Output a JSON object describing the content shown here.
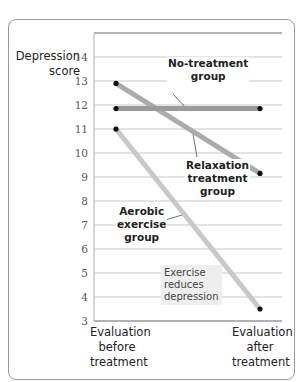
{
  "chart_data": {
    "type": "line",
    "title": "",
    "xlabel": "",
    "ylabel": "Depression score",
    "ylim": [
      3,
      14
    ],
    "yticks": [
      3,
      4,
      5,
      6,
      7,
      8,
      9,
      10,
      11,
      12,
      13,
      14
    ],
    "categories": [
      "Evaluation before treatment",
      "Evaluation after treatment"
    ],
    "grid": true,
    "series": [
      {
        "name": "No-treatment group",
        "values": [
          11.85,
          11.85
        ],
        "color": "#9b9b9b"
      },
      {
        "name": "Relaxation treatment group",
        "values": [
          12.9,
          9.15
        ],
        "color": "#acacac"
      },
      {
        "name": "Aerobic exercise group",
        "values": [
          11.0,
          3.5
        ],
        "color": "#c8c8c8"
      }
    ],
    "annotations": [
      "No-treatment group",
      "Relaxation treatment group",
      "Aerobic exercise group",
      "Exercise reduces depression"
    ]
  },
  "ylabel": {
    "line1": "Depression",
    "line2": "score"
  },
  "ticks": [
    "14",
    "13",
    "12",
    "11",
    "10",
    "9",
    "8",
    "7",
    "6",
    "5",
    "4",
    "3"
  ],
  "xlabels": {
    "before": {
      "l1": "Evaluation",
      "l2": "before",
      "l3": "treatment"
    },
    "after": {
      "l1": "Evaluation",
      "l2": "after",
      "l3": "treatment"
    }
  },
  "labels": {
    "no_treatment": {
      "l1": "No-treatment",
      "l2": "group"
    },
    "relaxation": {
      "l1": "Relaxation",
      "l2": "treatment",
      "l3": "group"
    },
    "aerobic": {
      "l1": "Aerobic",
      "l2": "exercise",
      "l3": "group"
    },
    "note": {
      "l1": "Exercise",
      "l2": "reduces",
      "l3": "depression"
    }
  }
}
